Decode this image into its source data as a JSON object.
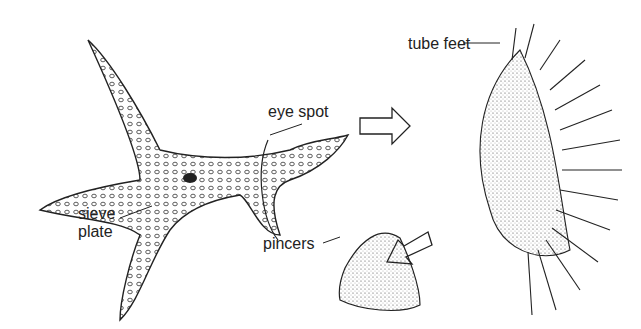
{
  "diagram": {
    "labels": {
      "tube_feet": "tube feet",
      "eye_spot": "eye spot",
      "sieve_plate_line1": "sieve",
      "sieve_plate_line2": "plate",
      "pincers": "pincers"
    },
    "colors": {
      "ink": "#222222",
      "background": "#ffffff"
    }
  }
}
